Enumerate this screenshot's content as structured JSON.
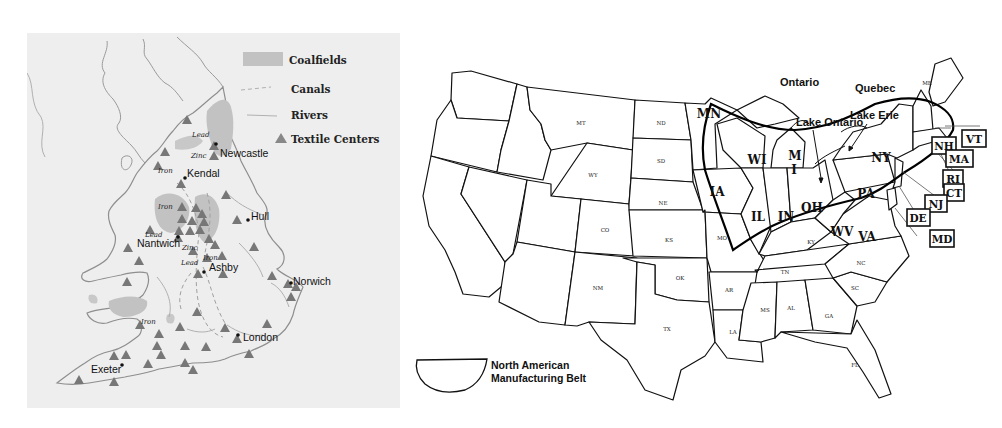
{
  "uk_map": {
    "legend": {
      "items": [
        {
          "label": "Coalfields",
          "symbol": "gray-fill"
        },
        {
          "label": "Canals",
          "symbol": "dashed-line"
        },
        {
          "label": "Rivers",
          "symbol": "thin-line"
        },
        {
          "label": "Textile Centers",
          "symbol": "triangle"
        }
      ]
    },
    "cities": [
      {
        "name": "Newcastle"
      },
      {
        "name": "Kendal"
      },
      {
        "name": "Hull"
      },
      {
        "name": "Nantwich"
      },
      {
        "name": "Ashby"
      },
      {
        "name": "Norwich"
      },
      {
        "name": "London"
      },
      {
        "name": "Exeter"
      }
    ],
    "minerals": {
      "lead": "Lead",
      "zinc": "Zinc",
      "iron": "Iron"
    },
    "colors": {
      "background": "#eeeeee",
      "coalfield": "#c2c2c2",
      "triangle": "#777777",
      "coast": "#9a9a9a"
    }
  },
  "us_map": {
    "regions": {
      "ontario": "Ontario",
      "quebec": "Quebec",
      "lake_ontario": "Lake Ontario",
      "lake_erie": "Lake Erie"
    },
    "states_small": {
      "MT": "MT",
      "ND": "ND",
      "SD": "SD",
      "WY": "WY",
      "NE": "NE",
      "CO": "CO",
      "KS": "KS",
      "NM": "NM",
      "OK": "OK",
      "TX": "TX",
      "MO": "MO",
      "AR": "AR",
      "LA": "LA",
      "MS": "MS",
      "AL": "AL",
      "GA": "GA",
      "TN": "TN",
      "KY": "KY",
      "NC": "NC",
      "SC": "SC",
      "FL": "FL",
      "ME": "ME"
    },
    "states_large": {
      "MN": "MN",
      "WI": "WI",
      "MI": "M",
      "MI2": "I",
      "IA": "IA",
      "IL": "IL",
      "IN": "IN",
      "OH": "OH",
      "PA": "PA",
      "NY": "NY",
      "WV": "WV",
      "VA": "VA"
    },
    "boxed_states": {
      "VT": "VT",
      "NH": "NH",
      "MA": "MA",
      "RI": "RI",
      "CT": "CT",
      "NJ": "NJ",
      "DE": "DE",
      "MD": "MD"
    },
    "legend": {
      "line1": "North American",
      "line2": "Manufacturing Belt"
    }
  }
}
